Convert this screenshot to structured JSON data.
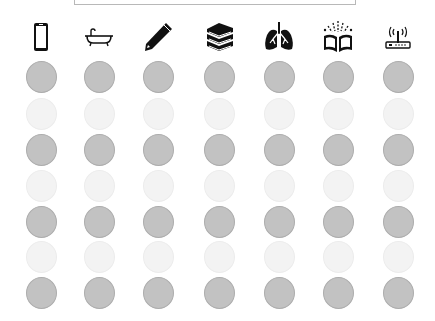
{
  "top_box": {
    "text": ""
  },
  "columns": [
    {
      "icon": "smartphone-icon",
      "x": 41
    },
    {
      "icon": "bathtub-icon",
      "x": 99
    },
    {
      "icon": "pencil-icon",
      "x": 158
    },
    {
      "icon": "books-stack-icon",
      "x": 219
    },
    {
      "icon": "lungs-icon",
      "x": 279
    },
    {
      "icon": "open-book-magic-icon",
      "x": 338
    },
    {
      "icon": "wifi-router-icon",
      "x": 398
    }
  ],
  "rows": [
    {
      "y": 77,
      "shade": "dark"
    },
    {
      "y": 114,
      "shade": "light"
    },
    {
      "y": 150,
      "shade": "dark"
    },
    {
      "y": 186,
      "shade": "light"
    },
    {
      "y": 222,
      "shade": "dark"
    },
    {
      "y": 257,
      "shade": "light"
    },
    {
      "y": 293,
      "shade": "dark"
    }
  ],
  "colors": {
    "dark_circle": "#c2c2c2",
    "light_circle": "#f3f3f3",
    "icon": "#111111"
  }
}
